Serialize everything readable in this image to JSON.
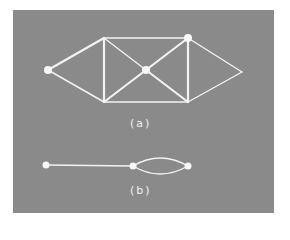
{
  "figure": {
    "background_color": "#8a8a8a",
    "line_color": "#f2f2f2",
    "graphs": [
      {
        "id": "a",
        "label": "(a)",
        "nodes": [
          {
            "id": "left",
            "x": 48,
            "y": 70,
            "marked": true
          },
          {
            "id": "top-left",
            "x": 104,
            "y": 38,
            "marked": false
          },
          {
            "id": "top-right",
            "x": 188,
            "y": 38,
            "marked": true
          },
          {
            "id": "center",
            "x": 146,
            "y": 70,
            "marked": true
          },
          {
            "id": "bottom-left",
            "x": 104,
            "y": 102,
            "marked": false
          },
          {
            "id": "bottom-right",
            "x": 188,
            "y": 102,
            "marked": false
          },
          {
            "id": "right",
            "x": 242,
            "y": 72,
            "marked": false
          }
        ],
        "edges": [
          [
            "left",
            "top-left"
          ],
          [
            "left",
            "bottom-left"
          ],
          [
            "top-left",
            "top-right"
          ],
          [
            "bottom-left",
            "bottom-right"
          ],
          [
            "top-left",
            "bottom-left"
          ],
          [
            "top-right",
            "bottom-right"
          ],
          [
            "top-left",
            "center"
          ],
          [
            "center",
            "bottom-right"
          ],
          [
            "bottom-left",
            "center"
          ],
          [
            "center",
            "top-right"
          ],
          [
            "top-right",
            "right"
          ],
          [
            "bottom-right",
            "right"
          ]
        ]
      },
      {
        "id": "b",
        "label": "(b)",
        "nodes": [
          {
            "id": "b-left",
            "x": 46,
            "y": 165
          },
          {
            "id": "b-middle",
            "x": 133,
            "y": 166
          },
          {
            "id": "b-right",
            "x": 188,
            "y": 166
          }
        ],
        "edges": [
          [
            "b-left",
            "b-middle",
            "straight"
          ],
          [
            "b-middle",
            "b-right",
            "arc-up"
          ],
          [
            "b-middle",
            "b-right",
            "arc-down"
          ]
        ]
      }
    ]
  }
}
